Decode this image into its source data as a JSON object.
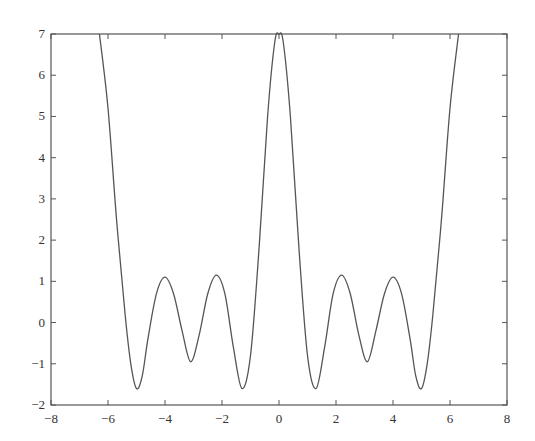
{
  "chart_data": {
    "type": "line",
    "title": "",
    "xlabel": "",
    "ylabel": "",
    "xlim": [
      -8,
      8
    ],
    "ylim": [
      -2,
      7
    ],
    "grid": false,
    "legend": null,
    "x_ticks": [
      -8,
      -6,
      -4,
      -2,
      0,
      2,
      4,
      6,
      8
    ],
    "y_ticks": [
      -2,
      -1,
      0,
      1,
      2,
      3,
      4,
      5,
      6,
      7
    ],
    "x_tick_labels": [
      "−8",
      "−6",
      "−4",
      "−2",
      "0",
      "2",
      "4",
      "6",
      "8"
    ],
    "y_tick_labels": [
      "−2",
      "−1",
      "0",
      "1",
      "2",
      "3",
      "4",
      "5",
      "6",
      "7"
    ],
    "note": "Symmetric about x=0. Turning points were estimated from the screenshot; intermediate points are an interpolated approximation.",
    "series": [
      {
        "name": "curve",
        "color": "#555555",
        "points": [
          [
            -6.3,
            7.0
          ],
          [
            -6.0,
            5.2
          ],
          [
            -5.7,
            2.5
          ],
          [
            -5.4,
            0.2
          ],
          [
            -5.2,
            -1.0
          ],
          [
            -5.0,
            -1.6
          ],
          [
            -4.8,
            -1.3
          ],
          [
            -4.6,
            -0.4
          ],
          [
            -4.3,
            0.7
          ],
          [
            -4.0,
            1.1
          ],
          [
            -3.7,
            0.7
          ],
          [
            -3.4,
            -0.2
          ],
          [
            -3.1,
            -0.95
          ],
          [
            -2.8,
            -0.3
          ],
          [
            -2.5,
            0.7
          ],
          [
            -2.2,
            1.15
          ],
          [
            -1.9,
            0.7
          ],
          [
            -1.6,
            -0.6
          ],
          [
            -1.3,
            -1.6
          ],
          [
            -1.0,
            -0.8
          ],
          [
            -0.7,
            1.8
          ],
          [
            -0.4,
            5.0
          ],
          [
            -0.15,
            6.8
          ],
          [
            0.0,
            7.0
          ],
          [
            0.15,
            6.8
          ],
          [
            0.4,
            5.0
          ],
          [
            0.7,
            1.8
          ],
          [
            1.0,
            -0.8
          ],
          [
            1.3,
            -1.6
          ],
          [
            1.6,
            -0.6
          ],
          [
            1.9,
            0.7
          ],
          [
            2.2,
            1.15
          ],
          [
            2.5,
            0.7
          ],
          [
            2.8,
            -0.3
          ],
          [
            3.1,
            -0.95
          ],
          [
            3.4,
            -0.2
          ],
          [
            3.7,
            0.7
          ],
          [
            4.0,
            1.1
          ],
          [
            4.3,
            0.7
          ],
          [
            4.6,
            -0.4
          ],
          [
            4.8,
            -1.3
          ],
          [
            5.0,
            -1.6
          ],
          [
            5.2,
            -1.0
          ],
          [
            5.4,
            0.2
          ],
          [
            5.7,
            2.5
          ],
          [
            6.0,
            5.2
          ],
          [
            6.3,
            7.0
          ]
        ]
      }
    ]
  },
  "layout": {
    "plot_left": 51,
    "plot_right": 507,
    "plot_top": 34,
    "plot_bottom": 405,
    "axis_color": "#555555",
    "line_color": "#555555"
  }
}
